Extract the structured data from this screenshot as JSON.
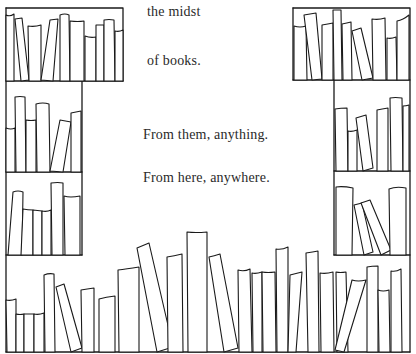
{
  "page": {
    "background_color": "#ffffff",
    "ink_color": "#1a1a1a",
    "lines": [
      {
        "id": "line-1",
        "text": "the midst",
        "x": 147,
        "y": 4
      },
      {
        "id": "line-2",
        "text": "of books.",
        "x": 147,
        "y": 53
      },
      {
        "id": "line-3",
        "text": "From them, anything.",
        "x": 143,
        "y": 127
      },
      {
        "id": "line-4",
        "text": "From here, anywhere.",
        "x": 143,
        "y": 170
      }
    ]
  },
  "illustration": {
    "description": "hand-drawn bookshelves framing text",
    "frame": {
      "outer_left": 6,
      "outer_right": 410,
      "left_column_inner": 82,
      "right_column_inner": 334,
      "top_left_box": [
        6,
        8,
        123,
        81
      ],
      "top_right_box": [
        293,
        8,
        410,
        80
      ],
      "shelves_y": [
        81,
        172,
        255,
        352
      ]
    }
  }
}
